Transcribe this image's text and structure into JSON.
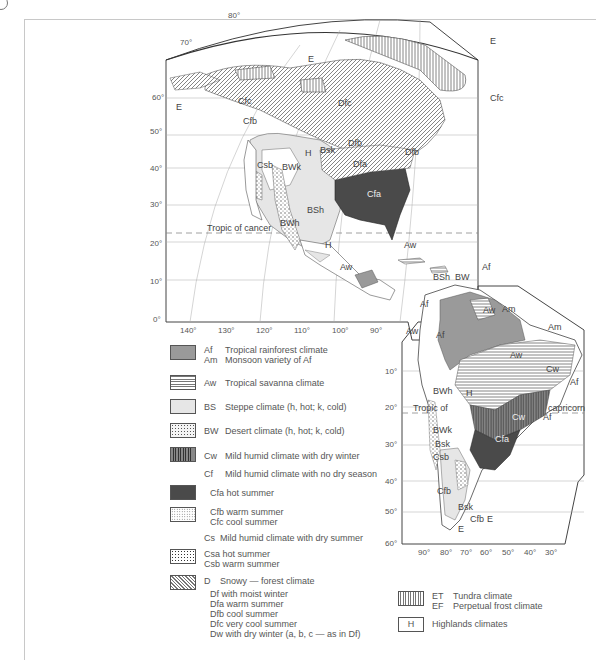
{
  "map": {
    "title": "Climate regions of the Americas",
    "latitude_labels_north": [
      "80°",
      "70°",
      "60°",
      "50°",
      "40°",
      "30°",
      "20°",
      "10°",
      "0°"
    ],
    "longitude_labels_north": [
      "140°",
      "130°",
      "120°",
      "110°",
      "100°",
      "90°"
    ],
    "latitude_labels_south": [
      "10°",
      "20°",
      "30°",
      "40°",
      "50°",
      "60°"
    ],
    "longitude_labels_south": [
      "90°",
      "80°",
      "70°",
      "60°",
      "50°",
      "40°",
      "30°"
    ],
    "tropic_of_cancer": "Tropic of cancer",
    "tropic_of_capricorn_left": "Tropic of",
    "tropic_of_capricorn_right": "capricorn",
    "region_labels": {
      "E": "E",
      "Cfc": "Cfc",
      "Cfb": "Cfb",
      "Dfc": "Dfc",
      "Dfb": "Dfb",
      "Dfa": "Dfa",
      "H": "H",
      "Bsk": "Bsk",
      "BWk": "BWk",
      "Csb": "Csb",
      "BSh": "BSh",
      "BWh": "BWh",
      "Cfa": "Cfa",
      "Af": "Af",
      "Aw": "Aw",
      "Am": "Am",
      "BW": "BW",
      "Cw": "Cw"
    }
  },
  "legend": {
    "items": [
      {
        "code": "Af",
        "desc": "Tropical rainforest climate",
        "sub_code": "Am",
        "sub_desc": "Monsoon variety of Af",
        "pattern": "af"
      },
      {
        "code": "Aw",
        "desc": "Tropical savanna climate",
        "pattern": "aw"
      },
      {
        "code": "BS",
        "desc": "Steppe climate (h, hot; k, cold)",
        "pattern": "bs"
      },
      {
        "code": "BW",
        "desc": "Desert climate (h, hot; k, cold)",
        "pattern": "bw"
      },
      {
        "code": "Cw",
        "desc": "Mild humid climate with  dry winter",
        "pattern": "cw"
      },
      {
        "code": "Cf",
        "desc": "Mild humid climate with no dry  season"
      },
      {
        "desc": "Cfa hot summer",
        "pattern": "cfa"
      },
      {
        "desc": "Cfb warm summer",
        "sub_desc": "Cfc cool summer",
        "pattern": "cfb"
      },
      {
        "code": "Cs",
        "desc": "Mild humid climate with dry summer"
      },
      {
        "desc": "Csa hot summer",
        "sub_desc": "Csb warm summer",
        "pattern": "cs"
      },
      {
        "code": "D",
        "desc": "Snowy — forest climate",
        "pattern": "d"
      },
      {
        "lines": [
          "Df with moist winter",
          "Dfa warm summer",
          "Dfb cool summer",
          "Dfc very cool summer",
          "Dw   with dry winter  (a, b, c — as in Df)"
        ]
      }
    ],
    "polar": {
      "code": "ET",
      "desc": "Tundra climate",
      "sub_code": "EF",
      "sub_desc": "Perpetual frost climate"
    },
    "highlands": {
      "swatch_label": "H",
      "desc": "Highlands climates"
    }
  },
  "colors": {
    "af": "#9a9a9a",
    "cfa": "#4a4a4a",
    "bs": "#dedede",
    "line": "#555555"
  }
}
